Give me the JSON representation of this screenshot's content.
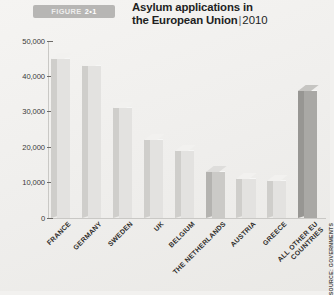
{
  "figure": {
    "badge_word": "FIGURE",
    "badge_number": "2•1",
    "title_line1": "Asylum applications in",
    "title_line2": "the European Union",
    "title_separator": "|",
    "title_year": "2010",
    "source": "SOURCE: GOVERNMENTS"
  },
  "colors": {
    "background": "#f2f1ef",
    "badge": "#b7b6b4",
    "bar_light": "#e3e2e0",
    "bar_mid": "#cbcac7",
    "bar_dark": "#a9a8a5",
    "axis": "#c9c8c5",
    "text": "#231f20"
  },
  "chart_data": {
    "type": "bar",
    "xlabel": "",
    "ylabel": "",
    "ylim": [
      0,
      50000
    ],
    "yticks": [
      0,
      10000,
      20000,
      30000,
      40000,
      50000
    ],
    "ytick_labels": [
      "0",
      "10,000",
      "20,000",
      "30,000",
      "40,000",
      "50,000"
    ],
    "grid": false,
    "legend": false,
    "categories": [
      "FRANCE",
      "GERMANY",
      "SWEDEN",
      "UK",
      "BELGIUM",
      "THE NETHERLANDS",
      "AUSTRIA",
      "GREECE",
      "ALL OTHER EU COUNTRIES"
    ],
    "category_lines": [
      [
        "FRANCE"
      ],
      [
        "GERMANY"
      ],
      [
        "SWEDEN"
      ],
      [
        "UK"
      ],
      [
        "BELGIUM"
      ],
      [
        "THE NETHERLANDS"
      ],
      [
        "AUSTRIA"
      ],
      [
        "GREECE"
      ],
      [
        "ALL OTHER EU",
        "COUNTRIES"
      ]
    ],
    "values": [
      45000,
      43000,
      31000,
      22000,
      19000,
      13000,
      11000,
      10500,
      36000
    ],
    "shades": [
      "light",
      "light",
      "light",
      "light",
      "light",
      "dark",
      "light",
      "light",
      "darkest"
    ]
  }
}
